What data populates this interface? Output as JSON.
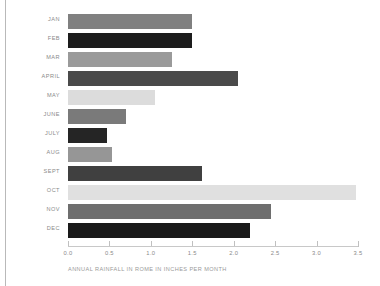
{
  "chart_data": {
    "type": "bar",
    "orientation": "horizontal",
    "title": "",
    "caption": "ANNUAL RAINFALL IN ROME IN INCHES PER MONTH",
    "xlabel": "",
    "ylabel": "",
    "xlim": [
      0.0,
      3.5
    ],
    "grid": false,
    "legend": null,
    "xticks": [
      "0.0",
      "0.5",
      "1.0",
      "1.5",
      "2.0",
      "2.5",
      "3.0",
      "3.5"
    ],
    "xtick_values": [
      0.0,
      0.5,
      1.0,
      1.5,
      2.0,
      2.5,
      3.0,
      3.5
    ],
    "categories": [
      "JAN",
      "FEB",
      "MAR",
      "APRIL",
      "MAY",
      "JUNE",
      "JULY",
      "AUG",
      "SEPT",
      "OCT",
      "NOV",
      "DEC"
    ],
    "values": [
      1.5,
      1.5,
      1.25,
      2.05,
      1.05,
      0.7,
      0.47,
      0.53,
      1.62,
      3.47,
      2.45,
      2.2
    ],
    "bar_colors": [
      "#808080",
      "#1c1c1c",
      "#9a9a9a",
      "#4a4a4a",
      "#dcdcdc",
      "#7a7a7a",
      "#252525",
      "#969696",
      "#404040",
      "#e0e0e0",
      "#6e6e6e",
      "#1a1a1a"
    ],
    "bars": [
      {
        "category": "JAN",
        "value": 1.5,
        "color": "#808080"
      },
      {
        "category": "FEB",
        "value": 1.5,
        "color": "#1c1c1c"
      },
      {
        "category": "MAR",
        "value": 1.25,
        "color": "#9a9a9a"
      },
      {
        "category": "APRIL",
        "value": 2.05,
        "color": "#4a4a4a"
      },
      {
        "category": "MAY",
        "value": 1.05,
        "color": "#dcdcdc"
      },
      {
        "category": "JUNE",
        "value": 0.7,
        "color": "#7a7a7a"
      },
      {
        "category": "JULY",
        "value": 0.47,
        "color": "#252525"
      },
      {
        "category": "AUG",
        "value": 0.53,
        "color": "#969696"
      },
      {
        "category": "SEPT",
        "value": 1.62,
        "color": "#404040"
      },
      {
        "category": "OCT",
        "value": 3.47,
        "color": "#e0e0e0"
      },
      {
        "category": "NOV",
        "value": 2.45,
        "color": "#6e6e6e"
      },
      {
        "category": "DEC",
        "value": 2.2,
        "color": "#1a1a1a"
      }
    ]
  },
  "style": {
    "background": "#ffffff",
    "axis_color": "#c8c8c8",
    "label_color": "#8a8a8a",
    "caption_color": "#9a9a9a",
    "rule_color": "#b9b9b9"
  }
}
